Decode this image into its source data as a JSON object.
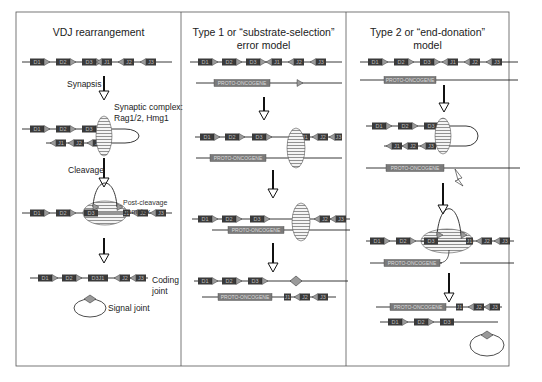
{
  "panels": [
    {
      "id": "vdj",
      "title": "VDJ rearrangement"
    },
    {
      "id": "type1",
      "title": "Type 1 or “substrate-selection”",
      "title2": "error model"
    },
    {
      "id": "type2",
      "title": "Type 2 or “end-donation”",
      "title2": "model"
    }
  ],
  "labels": {
    "synapsis": "Synapsis",
    "synaptic_complex": "Synaptic complex:",
    "synaptic_proteins": "Rag1/2, Hmg1",
    "cleavage": "Cleavage",
    "post_cleavage": "Post-cleavage",
    "post_cleavage2": "complex",
    "coding": "Coding",
    "coding2": "joint",
    "signal_joint": "Signal joint",
    "proto_oncogene": "PROTO-ONCOGENE"
  },
  "segments": {
    "d": [
      "D1",
      "D2",
      "D3"
    ],
    "j": [
      "J1",
      "J2",
      "J3"
    ],
    "dj": "D3J1"
  },
  "colors": {
    "segment_fill": "#3a3a3a",
    "proto_fill": "#7a7a7a",
    "rss_fill": "#9a9a9a",
    "line": "#222222",
    "border": "#555555",
    "hatch": "#777777"
  }
}
